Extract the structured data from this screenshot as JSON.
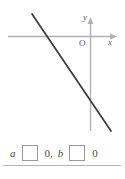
{
  "figure": {
    "name": "coordinate-plane-with-decreasing-line",
    "axes": {
      "y_label": "y",
      "x_label": "x",
      "origin_label": "O"
    },
    "line": {
      "description": "straight line with negative slope crossing x-axis left of origin and y-axis below origin",
      "x_intercept_sign": "negative",
      "y_intercept_sign": "negative",
      "slope_sign": "negative"
    },
    "colors": {
      "axis": "#b0b0b0",
      "line": "#3a3a3a",
      "text": "#555555",
      "box_border": "#9a9a9a",
      "rule": "#b4b4b4"
    }
  },
  "answer": {
    "term_a": "a",
    "term_b": "b",
    "zero_a": "0",
    "zero_b": "0",
    "comma": ",",
    "blank_a_value": "",
    "blank_b_value": ""
  }
}
